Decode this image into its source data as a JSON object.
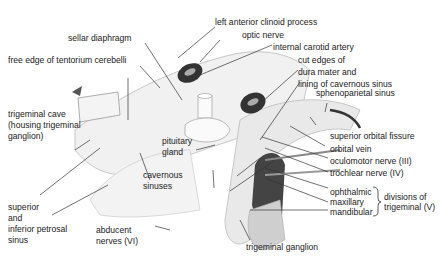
{
  "diagram": {
    "labels": {
      "left_anterior_clinoid_process": "left anterior clinoid process",
      "sellar_diaphragm": "sellar diaphragm",
      "optic_nerve": "optic nerve",
      "free_edge_tentorium": "free edge of tentorium cerebelli",
      "internal_carotid_artery": "internal carotid artery",
      "cut_edges_1": "cut edges of",
      "cut_edges_2": "dura mater and",
      "cut_edges_3": "lining of cavernous sinus",
      "sphenoparietal_sinus": "sphenoparietal sinus",
      "trigeminal_cave_1": "trigeminal cave",
      "trigeminal_cave_2": "(housing trigeminal",
      "trigeminal_cave_3": "ganglion)",
      "superior_orbital_fissure": "superior orbital fissure",
      "orbital_vein": "orbital vein",
      "pituitary_1": "pituitary",
      "pituitary_2": "gland",
      "oculomotor": "oculomotor nerve (III)",
      "trochlear": "trochlear nerve (IV)",
      "cavernous_1": "cavernous",
      "cavernous_2": "sinuses",
      "ophthalmic": "ophthalmic",
      "maxillary": "maxillary",
      "mandibular": "mandibular",
      "divisions_1": "divisions of",
      "divisions_2": "trigeminal (V)",
      "petrosal_1": "superior",
      "petrosal_2": "and",
      "petrosal_3": "inferior petrosal",
      "petrosal_4": "sinus",
      "abducent_1": "abducent",
      "abducent_2": "nerves (VI)",
      "trigeminal_ganglion": "trigeminal ganglion"
    }
  }
}
